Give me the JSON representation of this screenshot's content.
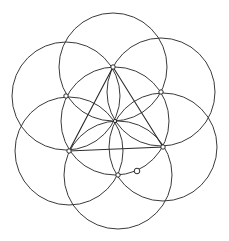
{
  "canvas": {
    "width": 229,
    "height": 241,
    "background": "#ffffff",
    "stroke": "#3a3a3a"
  },
  "radius": 54,
  "center": {
    "x": 115,
    "y": 121
  },
  "points": [
    {
      "id": "top",
      "x": 113,
      "y": 67
    },
    {
      "id": "upper-right",
      "x": 161,
      "y": 92
    },
    {
      "id": "lower-right",
      "x": 163,
      "y": 147
    },
    {
      "id": "bottom",
      "x": 118,
      "y": 175
    },
    {
      "id": "lower-left",
      "x": 69,
      "y": 151
    },
    {
      "id": "upper-left",
      "x": 66,
      "y": 96
    }
  ],
  "free_point": {
    "x": 137,
    "y": 171
  },
  "triangle": [
    "top",
    "lower-left",
    "lower-right"
  ]
}
